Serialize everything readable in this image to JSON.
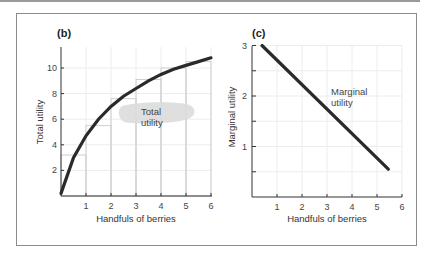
{
  "chart_data": [
    {
      "type": "line",
      "panel": "(b)",
      "title": "",
      "xlabel": "Handfuls of berries",
      "ylabel": "Total utility",
      "xlim": [
        0,
        6
      ],
      "ylim": [
        0,
        11.5
      ],
      "xticks": [
        "1",
        "2",
        "3",
        "4",
        "5",
        "6"
      ],
      "yticks": [
        "2",
        "4",
        "6",
        "8",
        "10"
      ],
      "grid": true,
      "series": [
        {
          "name": "Total utility",
          "x": [
            0,
            0.5,
            1,
            1.5,
            2,
            2.5,
            3,
            3.5,
            4,
            4.5,
            5,
            5.5,
            6
          ],
          "values": [
            0.2,
            3.0,
            4.7,
            6.0,
            7.0,
            7.8,
            8.4,
            9.0,
            9.5,
            9.9,
            10.2,
            10.5,
            10.8
          ]
        }
      ],
      "steps": {
        "x": [
          1,
          2,
          3,
          4,
          5,
          6
        ],
        "values": [
          3.2,
          5.5,
          7.6,
          9.1,
          10.0,
          10.5
        ]
      },
      "annotation": {
        "line1": "Total",
        "line2": "utility"
      }
    },
    {
      "type": "line",
      "panel": "(c)",
      "title": "",
      "xlabel": "Handfuls of berries",
      "ylabel": "Marginal utility",
      "xlim": [
        0,
        6
      ],
      "ylim": [
        0,
        3
      ],
      "xticks": [
        "1",
        "2",
        "3",
        "4",
        "5",
        "6"
      ],
      "yticks": [
        "1",
        "2",
        "3"
      ],
      "grid": true,
      "series": [
        {
          "name": "Marginal utility",
          "x": [
            0.4,
            5.45
          ],
          "values": [
            3.0,
            0.55
          ]
        }
      ],
      "annotation": {
        "line1": "Marginal",
        "line2": "utility"
      }
    }
  ]
}
